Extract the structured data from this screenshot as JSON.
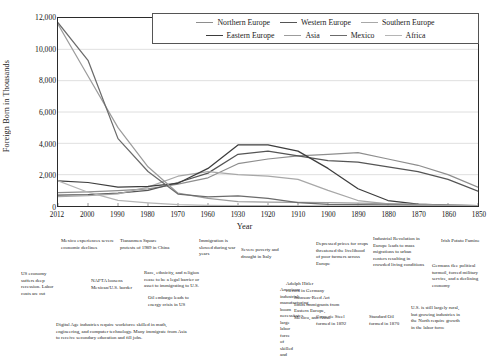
{
  "chart_data": {
    "type": "line",
    "title": "",
    "xlabel": "Year",
    "ylabel": "Foreign Born in Thousands",
    "x": [
      2012,
      2000,
      1990,
      1980,
      1970,
      1960,
      1930,
      1920,
      1910,
      1900,
      1890,
      1880,
      1870,
      1860,
      1850
    ],
    "categories": [
      "2012",
      "2000",
      "1990",
      "1980",
      "1970",
      "1960",
      "1930",
      "1920",
      "1910",
      "1900",
      "1890",
      "1880",
      "1870",
      "1860",
      "1850"
    ],
    "ylim": [
      0,
      12000
    ],
    "yticks": [
      0,
      2000,
      4000,
      6000,
      8000,
      10000,
      12000
    ],
    "ytick_labels": [
      "0",
      "2,000",
      "4,000",
      "6,000",
      "8,000",
      "10,000",
      "12,000"
    ],
    "grid": true,
    "legend_position": "top-right-inside",
    "series": [
      {
        "name": "Northern Europe",
        "color": "#8e8e8e",
        "values": [
          860,
          900,
          980,
          1100,
          1400,
          1800,
          2700,
          3000,
          3200,
          3300,
          3400,
          3000,
          2600,
          2000,
          1200
        ]
      },
      {
        "name": "Western Europe",
        "color": "#555555",
        "values": [
          700,
          720,
          820,
          1000,
          1500,
          2100,
          3300,
          3500,
          3200,
          2900,
          2800,
          2500,
          2200,
          1700,
          950
        ]
      },
      {
        "name": "Southern Europe",
        "color": "#a8a8a8",
        "values": [
          600,
          660,
          780,
          1200,
          1900,
          2200,
          2000,
          1900,
          1700,
          1000,
          350,
          130,
          70,
          40,
          20
        ]
      },
      {
        "name": "Eastern Europe",
        "color": "#3d3d3d",
        "values": [
          1600,
          1500,
          1200,
          1250,
          1450,
          2400,
          3900,
          3900,
          3500,
          2400,
          1100,
          350,
          120,
          50,
          20
        ]
      },
      {
        "name": "Asia",
        "color": "#9c9c9c",
        "values": [
          11600,
          8300,
          5000,
          2500,
          820,
          490,
          280,
          240,
          230,
          210,
          180,
          150,
          110,
          60,
          20
        ]
      },
      {
        "name": "Mexico",
        "color": "#6b6b6b",
        "values": [
          11700,
          9300,
          4300,
          2200,
          760,
          580,
          640,
          490,
          220,
          100,
          80,
          70,
          45,
          30,
          15
        ]
      },
      {
        "name": "Africa",
        "color": "#b5b5b5",
        "values": [
          1600,
          880,
          360,
          200,
          80,
          35,
          20,
          17,
          15,
          12,
          10,
          8,
          6,
          5,
          4
        ]
      }
    ]
  },
  "axis": {
    "y_title": "Foreign Born in Thousands",
    "x_title": "Year"
  },
  "legend": {
    "row1": [
      {
        "label": "Northern Europe",
        "color": "#8e8e8e"
      },
      {
        "label": "Western Europe",
        "color": "#555555"
      },
      {
        "label": "Southern Europe",
        "color": "#a8a8a8"
      }
    ],
    "row2": [
      {
        "label": "Eastern Europe",
        "color": "#3d3d3d"
      },
      {
        "label": "Asia",
        "color": "#9c9c9c"
      },
      {
        "label": "Mexico",
        "color": "#6b6b6b"
      },
      {
        "label": "Africa",
        "color": "#b5b5b5"
      }
    ]
  },
  "annotations": [
    {
      "id": "mexico-decline",
      "text": "Mexico experiences severe economic declines"
    },
    {
      "id": "tiananmen",
      "text": "Tiananmen Square protests of 1989 in China"
    },
    {
      "id": "war-years",
      "text": "Immigration is slowed during war years"
    },
    {
      "id": "italy-poverty",
      "text": "Severe poverty and drought in Italy"
    },
    {
      "id": "crop-prices",
      "text": "Depressed prices for crops threatened the livelihood of poor farmers across Europe"
    },
    {
      "id": "industrial-revolution",
      "text": "Industrial Revolution in Europe leads to mass migrations to urban centers resulting in crowded living conditions"
    },
    {
      "id": "irish-famine",
      "text": "Irish Potato Famine"
    },
    {
      "id": "us-recession",
      "text": "US economy suffers deep recession. Labor costs are cut"
    },
    {
      "id": "nafta",
      "text": "NAFTA loosens Mexican/U.S. border"
    },
    {
      "id": "race-ethnicity",
      "text": "Race, ethnicity, and religion cease to be a legal barrier or asset to immigrating to U.S."
    },
    {
      "id": "hitler",
      "text": "Adolph Hitler elected in Germany"
    },
    {
      "id": "manufacturing-boom",
      "text": "American industrial manufacturing boom necessitates large labor force of skilled and unskilled workers."
    },
    {
      "id": "germans-flee",
      "text": "Germans flee political turmoil, forced military service, and a declining economy"
    },
    {
      "id": "oil-embargo",
      "text": "Oil embargo leads to energy crisis in US"
    },
    {
      "id": "johnson-reed",
      "text": "Johnson-Reed Act limits immigrants from Eastern Europe, Mexico, and Asia"
    },
    {
      "id": "carnegie-steel",
      "text": "Carnegie Steel formed in 1892"
    },
    {
      "id": "standard-oil",
      "text": "Standard Oil formed in 1870"
    },
    {
      "id": "rural-north",
      "text": "U.S. is still largely rural, but growing industries in the North require growth in the labor force"
    },
    {
      "id": "digital-age",
      "text": "Digital Age industries require workforce skilled in math, engineering, and computer technology. Many immigrate from Asia to receive secondary education and fill jobs."
    }
  ]
}
